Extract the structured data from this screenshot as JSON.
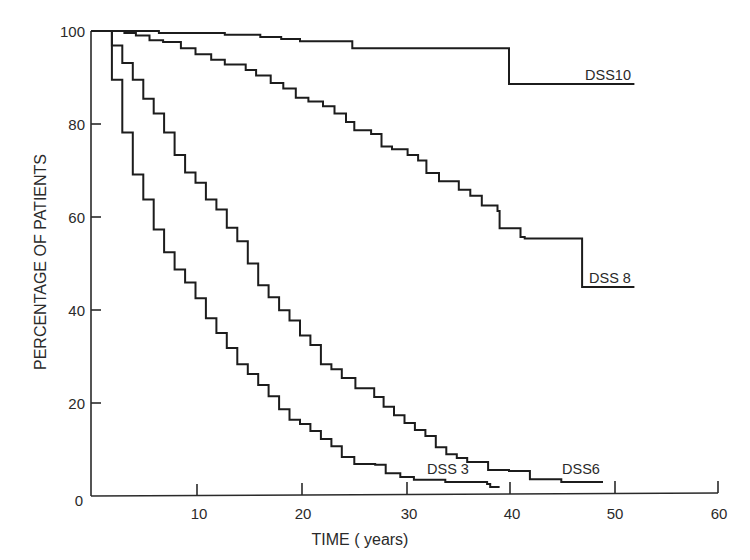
{
  "chart_data": {
    "type": "line",
    "subtype": "step (Kaplan-Meier survival)",
    "title": "",
    "xlabel": "TIME ( years)",
    "ylabel": "PERCENTAGE OF PATIENTS",
    "xlim": [
      0,
      60
    ],
    "ylim": [
      0,
      100
    ],
    "xticks": [
      0,
      10,
      20,
      30,
      40,
      50,
      60
    ],
    "xtick_labels": [
      "0",
      "10",
      "20",
      "30",
      "40",
      "50",
      "60"
    ],
    "yticks": [
      0,
      20,
      40,
      60,
      80,
      100
    ],
    "ytick_labels": [
      "0",
      "20",
      "40",
      "60",
      "80",
      "100"
    ],
    "grid": false,
    "legend": "inline labels at curve ends",
    "series": [
      {
        "name": "DSS 10",
        "label": "DSS10",
        "points": [
          [
            0,
            100
          ],
          [
            6.5,
            99.6
          ],
          [
            12.8,
            99.2
          ],
          [
            16.2,
            98.7
          ],
          [
            18.2,
            98.3
          ],
          [
            20,
            97.8
          ],
          [
            25,
            96.3
          ],
          [
            40,
            88.6
          ],
          [
            52,
            88.6
          ]
        ]
      },
      {
        "name": "DSS 8",
        "label": "DSS 8",
        "points": [
          [
            0,
            100
          ],
          [
            3.2,
            99.6
          ],
          [
            4.3,
            99
          ],
          [
            5.6,
            98
          ],
          [
            6.9,
            97.6
          ],
          [
            8.6,
            96.3
          ],
          [
            10,
            95
          ],
          [
            11.5,
            93.8
          ],
          [
            12.8,
            92.8
          ],
          [
            14.8,
            91.6
          ],
          [
            15.8,
            90.4
          ],
          [
            17.2,
            88.8
          ],
          [
            18.4,
            87.6
          ],
          [
            19.6,
            85.6
          ],
          [
            20.8,
            84.8
          ],
          [
            22.2,
            83.8
          ],
          [
            23.3,
            82.2
          ],
          [
            24.4,
            80.4
          ],
          [
            25.2,
            78.6
          ],
          [
            26.8,
            77.8
          ],
          [
            27.8,
            75.1
          ],
          [
            28.8,
            74.5
          ],
          [
            30.3,
            73.3
          ],
          [
            31.3,
            72.1
          ],
          [
            32.1,
            69.4
          ],
          [
            33.3,
            67.6
          ],
          [
            35.2,
            65.8
          ],
          [
            36.3,
            64.5
          ],
          [
            37.4,
            62.4
          ],
          [
            38.9,
            61.2
          ],
          [
            39.1,
            57.5
          ],
          [
            41.1,
            55.6
          ],
          [
            41.5,
            55.3
          ],
          [
            47,
            55.3
          ],
          [
            47,
            44.8
          ],
          [
            52,
            44.8
          ]
        ]
      },
      {
        "name": "DSS 6",
        "label": "DSS6",
        "points": [
          [
            0,
            100
          ],
          [
            2,
            96.9
          ],
          [
            3,
            93.1
          ],
          [
            4,
            89.5
          ],
          [
            5,
            85.4
          ],
          [
            6,
            82.2
          ],
          [
            7,
            78.1
          ],
          [
            8,
            73.3
          ],
          [
            9,
            69.5
          ],
          [
            10,
            67.3
          ],
          [
            11,
            63.7
          ],
          [
            12,
            61.5
          ],
          [
            13,
            57.6
          ],
          [
            14,
            54.7
          ],
          [
            15,
            49.9
          ],
          [
            16,
            45.2
          ],
          [
            17,
            42.6
          ],
          [
            18,
            39.8
          ],
          [
            19,
            37.6
          ],
          [
            20,
            34.4
          ],
          [
            21,
            32.3
          ],
          [
            22,
            28.2
          ],
          [
            23,
            27.1
          ],
          [
            24,
            25.2
          ],
          [
            25.3,
            23
          ],
          [
            27.1,
            21.1
          ],
          [
            28,
            19
          ],
          [
            29,
            17.2
          ],
          [
            30,
            15.5
          ],
          [
            31,
            14
          ],
          [
            32,
            12.7
          ],
          [
            33,
            10.3
          ],
          [
            34,
            8.8
          ],
          [
            35,
            8
          ],
          [
            36,
            7.1
          ],
          [
            38,
            5.4
          ],
          [
            40,
            5.2
          ],
          [
            42,
            3.4
          ],
          [
            45,
            2.8
          ],
          [
            49,
            2.8
          ]
        ]
      },
      {
        "name": "DSS 3",
        "label": "DSS 3",
        "points": [
          [
            0,
            100
          ],
          [
            2,
            89.5
          ],
          [
            3,
            78.1
          ],
          [
            4,
            69.1
          ],
          [
            5,
            63.7
          ],
          [
            6,
            57.2
          ],
          [
            7,
            52.3
          ],
          [
            8,
            48.6
          ],
          [
            9,
            45.8
          ],
          [
            10,
            42.4
          ],
          [
            11,
            38.1
          ],
          [
            12,
            34.9
          ],
          [
            13,
            31.7
          ],
          [
            14,
            28.2
          ],
          [
            15,
            26.1
          ],
          [
            16,
            23.7
          ],
          [
            17,
            21.3
          ],
          [
            18,
            18.5
          ],
          [
            19,
            16.2
          ],
          [
            20,
            15.3
          ],
          [
            21,
            13.8
          ],
          [
            22,
            12.1
          ],
          [
            23,
            10.5
          ],
          [
            24,
            8.2
          ],
          [
            25.2,
            6.7
          ],
          [
            27.2,
            6.5
          ],
          [
            28.2,
            4.7
          ],
          [
            29.6,
            3.9
          ],
          [
            30.9,
            3.3
          ],
          [
            33.9,
            2.8
          ],
          [
            37.9,
            2.4
          ],
          [
            38.2,
            1.7
          ],
          [
            39.1,
            1.7
          ]
        ]
      }
    ],
    "annotations": [
      "DSS10",
      "DSS 8",
      "DSS6",
      "DSS 3"
    ]
  },
  "labels": {
    "xlabel": "TIME ( years)",
    "ylabel": "PERCENTAGE OF PATIENTS",
    "series_dss10": "DSS10",
    "series_dss8": "DSS 8",
    "series_dss6": "DSS6",
    "series_dss3": "DSS 3",
    "x0": "0",
    "x10": "10",
    "x20": "20",
    "x30": "30",
    "x40": "40",
    "x50": "50",
    "x60": "60",
    "y20": "20",
    "y40": "40",
    "y60": "60",
    "y80": "80",
    "y100": "100"
  },
  "style": {
    "line_color": "#1c1c1c",
    "axis_color": "#2a2a2a",
    "background": "#ffffff"
  }
}
